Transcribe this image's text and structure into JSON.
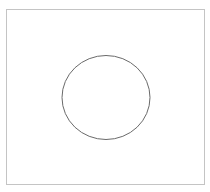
{
  "diagram": {
    "frame": {
      "x": 6.5,
      "y": 9.5,
      "width": 198,
      "height": 175,
      "stroke": "#c4c4c4",
      "stroke_width": 1
    },
    "circle": {
      "cx": 106,
      "cy": 97.5,
      "rx": 44,
      "ry": 42,
      "stroke": "#6a6a6a",
      "stroke_width": 1,
      "fill": "none"
    }
  }
}
